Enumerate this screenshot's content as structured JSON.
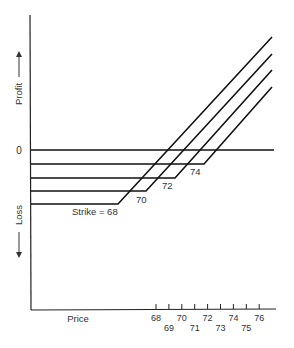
{
  "chart_data": {
    "type": "line",
    "title": "",
    "xlabel": "Price",
    "ylabel_up": "Profit",
    "ylabel_down": "Loss",
    "zero_label": "0",
    "x_ticks": [
      68,
      69,
      70,
      71,
      72,
      73,
      74,
      75,
      76
    ],
    "grid": false,
    "series": [
      {
        "name": "Strike = 68",
        "strike": 68,
        "label": "Strike = 68"
      },
      {
        "name": "70",
        "strike": 70,
        "label": "70"
      },
      {
        "name": "72",
        "strike": 72,
        "label": "72"
      },
      {
        "name": "74",
        "strike": 74,
        "label": "74"
      }
    ]
  }
}
